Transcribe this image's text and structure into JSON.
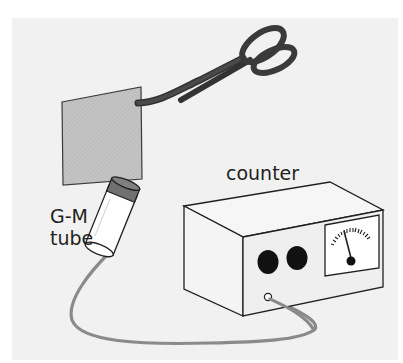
{
  "diagram": {
    "labels": {
      "counter": "counter",
      "gm_line1": "G-M",
      "gm_line2": "tube"
    },
    "components": [
      {
        "id": "tongs",
        "description": "tongs holding a sample"
      },
      {
        "id": "sample",
        "description": "square radioactive sample"
      },
      {
        "id": "gm-tube",
        "description": "Geiger-Muller tube"
      },
      {
        "id": "cable",
        "description": "cable connecting tube to counter"
      },
      {
        "id": "counter",
        "description": "counter box with two knobs, analog meter and input socket"
      }
    ],
    "colors": {
      "panel_bg": "#f1f1f1",
      "outline": "#231f20",
      "tongs": "#3a3a3a",
      "sample_fill": "#bdbdbd",
      "tube_cap": "#707070",
      "cable": "#8a8a8a",
      "knob": "#111111"
    }
  }
}
